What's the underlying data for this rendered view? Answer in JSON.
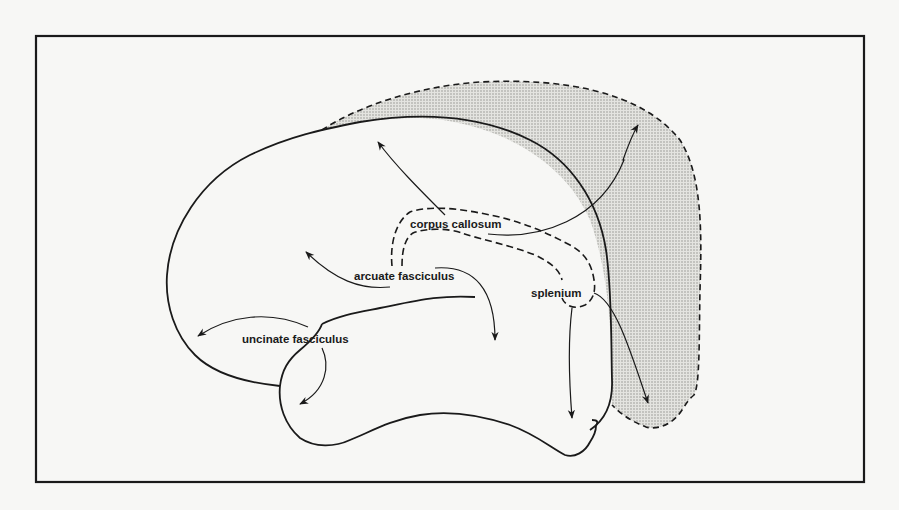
{
  "figure": {
    "type": "brain-white-matter-tracts",
    "colors": {
      "background": "#f7f7f5",
      "ink": "#1a1a1a",
      "shading": "#c9c9c5"
    }
  },
  "labels": {
    "corpus_callosum": "corpus callosum",
    "arcuate_fasciculus": "arcuate fasciculus",
    "uncinate_fasciculus": "uncinate fasciculus",
    "splenium": "splenium"
  }
}
